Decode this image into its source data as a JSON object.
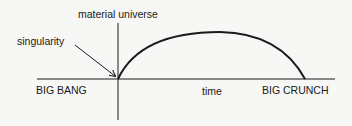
{
  "diagram": {
    "y_axis_label": "material universe",
    "x_axis_label": "time",
    "start_label": "BIG BANG",
    "end_label": "BIG CRUNCH",
    "annotation": "singularity",
    "colors": {
      "line": "#1a1a1a",
      "background": "#f7f7f5"
    }
  }
}
